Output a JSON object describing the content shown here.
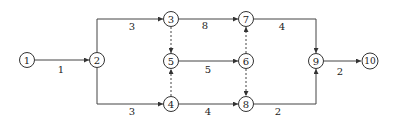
{
  "diagram": {
    "type": "activity-on-arrow network",
    "nodes": [
      {
        "id": "1",
        "label": "1",
        "x": 27,
        "y": 60
      },
      {
        "id": "2",
        "label": "2",
        "x": 97,
        "y": 60
      },
      {
        "id": "3",
        "label": "3",
        "x": 171,
        "y": 19
      },
      {
        "id": "4",
        "label": "4",
        "x": 171,
        "y": 104
      },
      {
        "id": "5",
        "label": "5",
        "x": 171,
        "y": 61
      },
      {
        "id": "6",
        "label": "6",
        "x": 246,
        "y": 61
      },
      {
        "id": "7",
        "label": "7",
        "x": 246,
        "y": 19
      },
      {
        "id": "8",
        "label": "8",
        "x": 246,
        "y": 104
      },
      {
        "id": "9",
        "label": "9",
        "x": 316,
        "y": 61
      },
      {
        "id": "10",
        "label": "10",
        "x": 370,
        "y": 61
      }
    ],
    "edges": [
      {
        "from": "1",
        "to": "2",
        "duration": "1",
        "dummy": false
      },
      {
        "from": "2",
        "to": "3",
        "duration": "3",
        "dummy": false
      },
      {
        "from": "2",
        "to": "4",
        "duration": "3",
        "dummy": false
      },
      {
        "from": "3",
        "to": "7",
        "duration": "8",
        "dummy": false
      },
      {
        "from": "3",
        "to": "5",
        "duration": "",
        "dummy": true
      },
      {
        "from": "4",
        "to": "5",
        "duration": "",
        "dummy": true
      },
      {
        "from": "4",
        "to": "8",
        "duration": "4",
        "dummy": false
      },
      {
        "from": "5",
        "to": "6",
        "duration": "5",
        "dummy": false
      },
      {
        "from": "6",
        "to": "7",
        "duration": "",
        "dummy": true
      },
      {
        "from": "6",
        "to": "8",
        "duration": "",
        "dummy": true
      },
      {
        "from": "7",
        "to": "9",
        "duration": "4",
        "dummy": false
      },
      {
        "from": "8",
        "to": "9",
        "duration": "2",
        "dummy": false
      },
      {
        "from": "9",
        "to": "10",
        "duration": "2",
        "dummy": false
      }
    ]
  }
}
